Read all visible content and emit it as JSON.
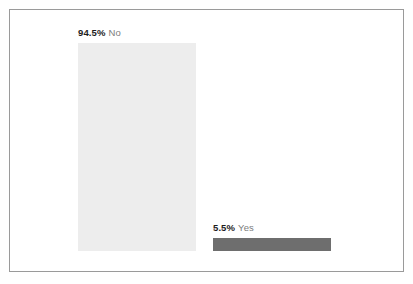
{
  "chart_data": {
    "type": "bar",
    "orientation": "vertical",
    "title": "",
    "subtitle": "",
    "xlabel": "",
    "ylabel": "",
    "grid": false,
    "legend": false,
    "axis_visible": false,
    "ylim": [
      0,
      100
    ],
    "value_unit": "%",
    "categories": [
      "No",
      "Yes"
    ],
    "values": [
      94.5,
      5.5
    ],
    "value_labels": [
      "94.5%",
      "5.5%"
    ],
    "series": [
      {
        "name": "share",
        "values": [
          94.5,
          5.5
        ]
      }
    ],
    "points": [
      {
        "category": "No",
        "value": 94.5,
        "value_label": "94.5%",
        "color": "#ededed"
      },
      {
        "category": "Yes",
        "value": 5.5,
        "value_label": "5.5%",
        "color": "#6e6e6e"
      }
    ],
    "colors": {
      "bar_no": "#ededed",
      "bar_yes": "#6e6e6e",
      "frame_border": "#9a9a9a",
      "background": "#ffffff",
      "value_text": "#1c1c1c",
      "category_text": "#7c7c7c"
    }
  }
}
